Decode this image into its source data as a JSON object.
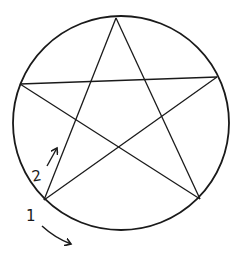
{
  "diagram": {
    "type": "pentagram-in-circle",
    "stroke_color": "#1a1a1a",
    "background": "#ffffff",
    "circle": {
      "cx": 121,
      "cy": 123,
      "rx": 108,
      "ry": 107
    },
    "vertices": {
      "top": [
        116,
        18
      ],
      "left": [
        20,
        84
      ],
      "right": [
        217,
        77
      ],
      "bottom_left": [
        44,
        200
      ],
      "bottom_right": [
        200,
        199
      ]
    },
    "annotations": [
      {
        "id": "step-1",
        "text": "1",
        "x": 26,
        "y": 209,
        "arrow_direction": "along-circle-clockwise"
      },
      {
        "id": "step-2",
        "text": "2",
        "x": 32,
        "y": 169,
        "arrow_direction": "up-along-star-line"
      }
    ]
  }
}
